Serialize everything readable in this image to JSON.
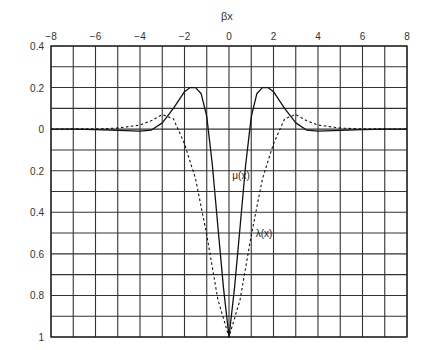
{
  "chart_data": {
    "type": "line",
    "title": "",
    "xlabel": "βx",
    "ylabel": "",
    "xlim": [
      -8,
      8
    ],
    "ylim_display_top_to_bottom": [
      0.4,
      -1.0
    ],
    "x_ticks": [
      -8,
      -6,
      -4,
      -2,
      0,
      2,
      4,
      6,
      8
    ],
    "x_tick_labels": [
      "−8",
      "−6",
      "−4",
      "−2",
      "0",
      "2",
      "4",
      "6",
      "8"
    ],
    "y_ticks": [
      0.4,
      0.2,
      0,
      -0.2,
      -0.4,
      -0.6,
      -0.8,
      -1.0
    ],
    "y_tick_labels": [
      "0.4",
      "0.2",
      "0",
      "0.2",
      "0.4",
      "0.6",
      "0.8",
      "1"
    ],
    "grid": true,
    "grid_x_step": 1,
    "grid_y_step": 0.1,
    "x_axis_position": "top",
    "legend": null,
    "series": [
      {
        "name": "μ(x)",
        "style": "solid",
        "x": [
          -8,
          -7,
          -6,
          -5,
          -4,
          -3.5,
          -3,
          -2.5,
          -2,
          -1.75,
          -1.5,
          -1.25,
          -1,
          -0.75,
          -0.5,
          -0.25,
          0,
          0.25,
          0.5,
          0.75,
          1,
          1.25,
          1.5,
          1.75,
          2,
          2.5,
          3,
          3.5,
          4,
          5,
          6,
          7,
          8
        ],
        "y": [
          0.0,
          0.0,
          -0.002,
          -0.006,
          -0.01,
          -0.005,
          0.03,
          0.1,
          0.18,
          0.2,
          0.2,
          0.17,
          0.06,
          -0.17,
          -0.47,
          -0.76,
          -1.0,
          -0.76,
          -0.47,
          -0.17,
          0.06,
          0.17,
          0.2,
          0.2,
          0.18,
          0.1,
          0.03,
          -0.005,
          -0.01,
          -0.006,
          -0.002,
          0.0,
          0.0
        ]
      },
      {
        "name": "λ(x)",
        "style": "dashed",
        "x": [
          -8,
          -7,
          -6,
          -5,
          -4,
          -3.5,
          -3,
          -2.5,
          -2,
          -1.5,
          -1,
          -0.5,
          0,
          0.5,
          1,
          1.5,
          2,
          2.5,
          3,
          3.5,
          4,
          5,
          6,
          7,
          8
        ],
        "y": [
          0.0,
          0.001,
          0.001,
          0.005,
          0.02,
          0.04,
          0.07,
          0.05,
          -0.07,
          -0.24,
          -0.51,
          -0.82,
          -1.0,
          -0.82,
          -0.51,
          -0.24,
          -0.07,
          0.05,
          0.07,
          0.04,
          0.02,
          0.005,
          0.001,
          0.001,
          0.0
        ]
      }
    ],
    "annotations": [
      {
        "text": "μ(x)",
        "x": 0.15,
        "y": -0.24
      },
      {
        "text": "λ(x)",
        "x": 1.2,
        "y": -0.52
      }
    ]
  },
  "labels": {
    "xlabel": "βx",
    "mu": "μ(x)",
    "lambda": "λ(x)"
  }
}
